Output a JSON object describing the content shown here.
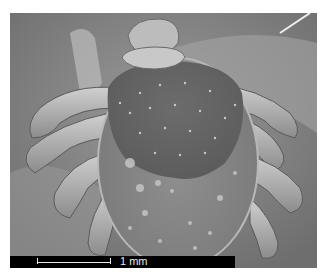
{
  "image": {
    "subject": "Scanning electron micrograph of a tick (dorsal view)",
    "subject_icon": "tick-specimen",
    "colors": {
      "background": "#8a8a8a",
      "scutum": "#6a6a6a",
      "body": "#8f8f8f",
      "highlight": "#d8d8d8",
      "scale_strip": "#000000",
      "scale_text": "#e8e8e8"
    }
  },
  "scale_bar": {
    "label": "1 mm"
  }
}
